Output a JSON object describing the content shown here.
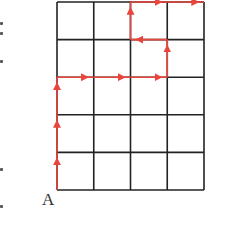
{
  "diagram": {
    "type": "grid-path",
    "grid": {
      "columns": 4,
      "rows": 5,
      "line_color": "#222222"
    },
    "start_label": "A",
    "path_color": "#e8453c",
    "path": [
      [
        0,
        0
      ],
      [
        0,
        1
      ],
      [
        0,
        2
      ],
      [
        0,
        3
      ],
      [
        1,
        3
      ],
      [
        2,
        3
      ],
      [
        3,
        3
      ],
      [
        3,
        4
      ],
      [
        2,
        4
      ],
      [
        2,
        5
      ],
      [
        3,
        5
      ],
      [
        4,
        5
      ]
    ],
    "moves": [
      "up",
      "up",
      "up",
      "right",
      "right",
      "right",
      "up",
      "left",
      "up",
      "right",
      "right"
    ]
  }
}
